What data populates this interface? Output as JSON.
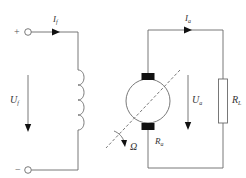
{
  "diagram": {
    "type": "dc-generator-circuit",
    "colors": {
      "wire": "#6a6a6a",
      "brush": "#111111",
      "text": "#333333",
      "background": "#ffffff"
    },
    "field_circuit": {
      "plus_sign": "+",
      "minus_sign": "−",
      "current_label": {
        "main": "I",
        "sub": "f"
      },
      "voltage_label": {
        "main": "U",
        "sub": "f"
      },
      "component": "field-winding-inductor"
    },
    "armature_circuit": {
      "current_label": {
        "main": "I",
        "sub": "a"
      },
      "voltage_label": {
        "main": "U",
        "sub": "a"
      },
      "armature_resistance_label": {
        "main": "R",
        "sub": "a"
      },
      "load_label": {
        "main": "R",
        "sub": "L"
      },
      "rotation_label": "Ω",
      "component": "dc-machine-armature"
    }
  }
}
